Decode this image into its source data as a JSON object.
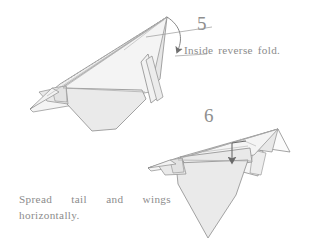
{
  "page": {
    "width": 311,
    "height": 249,
    "background_color": "#ffffff"
  },
  "colors": {
    "paper_fill": "#eeeeee",
    "paper_fill_light": "#f6f6f6",
    "paper_fill_dark": "#e4e4e4",
    "outline": "#8a8a8a",
    "crease_line": "#a8a8a8",
    "text": "#8c8c8c",
    "arrow": "#707070"
  },
  "steps": [
    {
      "number": "5",
      "caption": "Inside reverse fold.",
      "annotation_icon": "curved-down-arrow-icon",
      "figure_name": "paper-plane-step-5"
    },
    {
      "number": "6",
      "caption_line_1": "Spread tail and wings",
      "caption_line_2": "horizontally.",
      "caption_full": "Spread tail and wings horizontally.",
      "annotation_icon": "down-arrow-icon",
      "figure_name": "paper-plane-step-6"
    }
  ]
}
